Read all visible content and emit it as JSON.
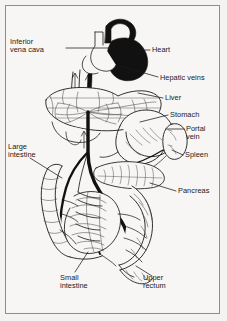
{
  "figure": {
    "background_color": "#f7f6f4",
    "ink_color": "#1a1a1a",
    "vessel_fill": "#111111",
    "frame_color": "#8d8d8d"
  },
  "labels": [
    {
      "id": "inferior-vena-cava",
      "text": "Inferior\nvena cava",
      "x": 10,
      "y": 38,
      "align": "left"
    },
    {
      "id": "heart",
      "text": "Heart",
      "x": 152,
      "y": 46,
      "align": "left"
    },
    {
      "id": "hepatic-veins",
      "text": "Hepatic veins",
      "x": 160,
      "y": 74,
      "align": "left"
    },
    {
      "id": "liver",
      "text": "Liver",
      "x": 165,
      "y": 96,
      "align": "left"
    },
    {
      "id": "stomach",
      "text": "Stomach",
      "x": 170,
      "y": 113,
      "align": "left"
    },
    {
      "id": "portal-vein",
      "text": "Portal\nvein",
      "x": 186,
      "y": 126,
      "align": "left"
    },
    {
      "id": "spleen",
      "text": "Spleen",
      "x": 185,
      "y": 152,
      "align": "left"
    },
    {
      "id": "large-intestine",
      "text": "Large\nintestine",
      "x": 8,
      "y": 143,
      "align": "left"
    },
    {
      "id": "pancreas",
      "text": "Pancreas",
      "x": 178,
      "y": 189,
      "align": "left"
    },
    {
      "id": "small-intestine",
      "text": "Small\nintestine",
      "x": 60,
      "y": 275,
      "align": "left"
    },
    {
      "id": "upper-rectum",
      "text": "Upper\nrectum",
      "x": 143,
      "y": 275,
      "align": "left"
    }
  ],
  "structures": [
    {
      "id": "heart",
      "name": "heart",
      "rendering": "solid-black-mass"
    },
    {
      "id": "inferior-vena-cava",
      "name": "inferior vena cava",
      "rendering": "outlined-vessel"
    },
    {
      "id": "hepatic-veins",
      "name": "hepatic veins",
      "rendering": "black-branching-vessels"
    },
    {
      "id": "liver",
      "name": "liver",
      "rendering": "outlined-organ-with-vascular-network"
    },
    {
      "id": "stomach",
      "name": "stomach",
      "rendering": "outlined-organ"
    },
    {
      "id": "spleen",
      "name": "spleen",
      "rendering": "outlined-oval-organ"
    },
    {
      "id": "pancreas",
      "name": "pancreas",
      "rendering": "outlined-lobulated-organ"
    },
    {
      "id": "portal-vein",
      "name": "portal vein",
      "rendering": "thick-black-trunk"
    },
    {
      "id": "large-intestine",
      "name": "large intestine",
      "rendering": "outlined-haustrated-bowel"
    },
    {
      "id": "small-intestine",
      "name": "small intestine",
      "rendering": "outlined-coiled-bowel"
    },
    {
      "id": "upper-rectum",
      "name": "upper rectum",
      "rendering": "outlined-bowel-segment"
    }
  ]
}
